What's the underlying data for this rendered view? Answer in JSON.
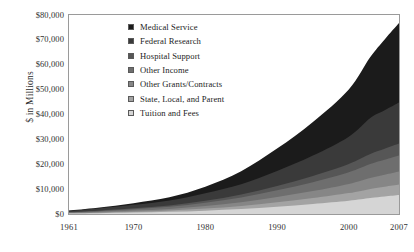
{
  "chart_data": {
    "type": "area",
    "stacked": true,
    "title": "",
    "subtitle": "",
    "xlabel": "",
    "ylabel": "$ in Millions",
    "xlim": [
      1961,
      2007
    ],
    "ylim": [
      0,
      80000
    ],
    "grid": false,
    "legend_position": "inside-upper-left",
    "x_tick_labels": [
      "1961",
      "1970",
      "1980",
      "1990",
      "2000",
      "2007"
    ],
    "x_tick_values": [
      1961,
      1970,
      1980,
      1990,
      2000,
      2007
    ],
    "y_tick_labels": [
      "$0",
      "$10,000",
      "$20,000",
      "$30,000",
      "$40,000",
      "$50,000",
      "$60,000",
      "$70,000",
      "$80,000"
    ],
    "y_tick_values": [
      0,
      10000,
      20000,
      30000,
      40000,
      50000,
      60000,
      70000,
      80000
    ],
    "x": [
      1961,
      1965,
      1970,
      1975,
      1980,
      1985,
      1990,
      1995,
      2000,
      2003,
      2005,
      2007
    ],
    "series": [
      {
        "name": "Medical Service",
        "color": "#1b1b1b",
        "values": [
          150,
          320,
          700,
          1300,
          2600,
          5200,
          9000,
          13500,
          19000,
          24500,
          28500,
          32000
        ]
      },
      {
        "name": "Federal Research",
        "color": "#3a3a3a",
        "values": [
          500,
          900,
          1400,
          2000,
          3100,
          4200,
          6000,
          8200,
          11000,
          14500,
          15500,
          16500
        ]
      },
      {
        "name": "Hospital Support",
        "color": "#565656",
        "values": [
          120,
          200,
          350,
          520,
          800,
          1200,
          1800,
          2500,
          3300,
          4000,
          4400,
          4800
        ]
      },
      {
        "name": "Other Income",
        "color": "#6e6e6e",
        "values": [
          200,
          330,
          560,
          850,
          1300,
          1900,
          2700,
          3600,
          4700,
          5600,
          6000,
          6400
        ]
      },
      {
        "name": "Other Grants/Contracts",
        "color": "#868686",
        "values": [
          150,
          250,
          420,
          640,
          980,
          1450,
          2100,
          2800,
          3700,
          4400,
          4800,
          5200
        ]
      },
      {
        "name": "State, Local, and Parent",
        "color": "#a3a3a3",
        "values": [
          130,
          220,
          380,
          560,
          850,
          1250,
          1800,
          2400,
          3100,
          3700,
          4000,
          4300
        ]
      },
      {
        "name": "Tuition and Fees",
        "color": "#d5d5d5",
        "values": [
          200,
          330,
          560,
          860,
          1350,
          2000,
          2900,
          4000,
          5300,
          6400,
          7000,
          7600
        ]
      }
    ],
    "legend_entries": [
      "Medical Service",
      "Federal Research",
      "Hospital Support",
      "Other Income",
      "Other Grants/Contracts",
      "State, Local, and Parent",
      "Tuition and Fees"
    ]
  }
}
